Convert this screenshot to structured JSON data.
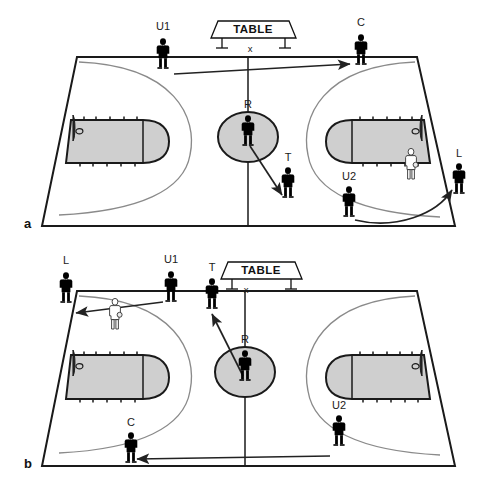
{
  "figure": {
    "background": "#ffffff",
    "ink": "#1a1a1a"
  },
  "colors": {
    "court_fill": "#ffffff",
    "key_fill": "#cfcfcf",
    "center_circle_fill": "#cfcfcf",
    "line": "#1a1a1a",
    "three_point_line": "#7d7d7d",
    "official_dark": "#3a3a3a",
    "official_mid": "#8c8c8c",
    "official_light": "#b9b9b9",
    "player_white": "#ffffff",
    "arrow": "#222222"
  },
  "panels": [
    {
      "id": "a",
      "panel_label": "a",
      "table": {
        "label": "TABLE",
        "center_mark": "x"
      },
      "officials": [
        {
          "code": "U1",
          "name": "umpire-1",
          "shade": "light",
          "label_pos": "above"
        },
        {
          "code": "C",
          "name": "center-official",
          "shade": "dark",
          "label_pos": "above"
        },
        {
          "code": "R",
          "name": "referee",
          "shade": "mid",
          "label_pos": "above"
        },
        {
          "code": "T",
          "name": "trail-official",
          "shade": "dark",
          "label_pos": "above"
        },
        {
          "code": "L",
          "name": "lead-official",
          "shade": "dark",
          "label_pos": "above"
        },
        {
          "code": "U2",
          "name": "umpire-2",
          "shade": "mid",
          "label_pos": "above"
        }
      ],
      "players": [
        {
          "name": "offensive-player-with-ball",
          "shade": "white",
          "has_ball": true
        }
      ],
      "movement_arrows": [
        {
          "from": "U1",
          "to": "C",
          "style": "straight"
        },
        {
          "from": "R",
          "to": "T",
          "style": "straight"
        },
        {
          "from": "U2",
          "to": "L",
          "style": "curved"
        }
      ]
    },
    {
      "id": "b",
      "panel_label": "b",
      "table": {
        "label": "TABLE",
        "center_mark": "x"
      },
      "officials": [
        {
          "code": "L",
          "name": "lead-official",
          "shade": "dark",
          "label_pos": "above"
        },
        {
          "code": "U1",
          "name": "umpire-1",
          "shade": "light",
          "label_pos": "above"
        },
        {
          "code": "T",
          "name": "trail-official",
          "shade": "dark",
          "label_pos": "above"
        },
        {
          "code": "R",
          "name": "referee",
          "shade": "mid",
          "label_pos": "above"
        },
        {
          "code": "C",
          "name": "center-official",
          "shade": "dark",
          "label_pos": "above"
        },
        {
          "code": "U2",
          "name": "umpire-2",
          "shade": "dark",
          "label_pos": "above"
        }
      ],
      "players": [
        {
          "name": "offensive-player-with-ball",
          "shade": "white",
          "has_ball": true
        }
      ],
      "movement_arrows": [
        {
          "from": "U1",
          "to": "L",
          "style": "straight"
        },
        {
          "from": "R",
          "to": "T",
          "style": "straight"
        },
        {
          "from": "U2",
          "to": "C",
          "style": "straight"
        }
      ]
    }
  ],
  "legend_codes": {
    "R": "Referee",
    "U1": "Umpire 1",
    "U2": "Umpire 2",
    "L": "Lead",
    "T": "Trail",
    "C": "Center"
  }
}
